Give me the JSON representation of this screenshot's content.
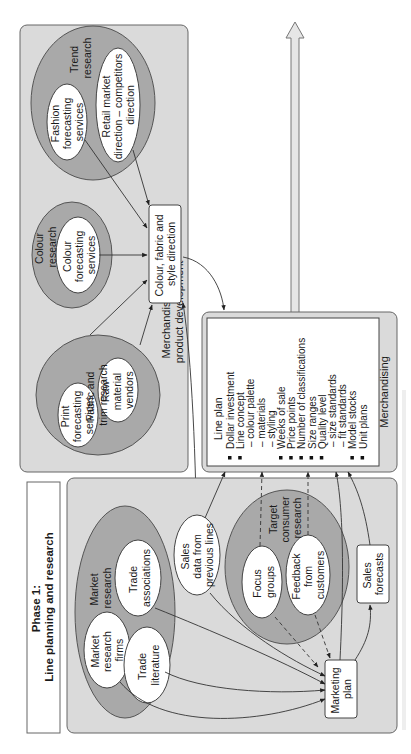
{
  "phase": {
    "title_line1": "Phase 1:",
    "title_line2": "Line planning and research"
  },
  "product_development_panel": {
    "label_line1": "Merchandising and",
    "label_line2": "product development",
    "fabric_trim": {
      "label_line1": "Fabric and",
      "label_line2": "trim research",
      "nodes": [
        {
          "l1": "Print",
          "l2": "forecasting",
          "l3": "services"
        },
        {
          "l1": "Raw",
          "l2": "material",
          "l3": "vendors"
        }
      ]
    },
    "colour": {
      "label_line1": "Colour",
      "label_line2": "research",
      "node": {
        "l1": "Colour",
        "l2": "forecasting",
        "l3": "services"
      }
    },
    "trend": {
      "label_line1": "Trend",
      "label_line2": "research",
      "nodes": [
        {
          "l1": "Fashion",
          "l2": "forecasting",
          "l3": "services"
        },
        {
          "l1": "Retail market",
          "l2": "direction – competitors",
          "l3": "direction"
        }
      ]
    },
    "direction_box": {
      "l1": "Colour, fabric and",
      "l2": "style direction"
    }
  },
  "market_panel": {
    "market_research": {
      "label_line1": "Market",
      "label_line2": "research",
      "nodes": [
        {
          "l1": "Market",
          "l2": "research",
          "l3": "firms"
        },
        {
          "l1": "Trade",
          "l2": "associations"
        },
        {
          "l1": "Trade",
          "l2": "literature"
        }
      ]
    },
    "sales_data": {
      "l1": "Sales",
      "l2": "data from",
      "l3": "previous lines"
    },
    "target_consumer": {
      "label_line1": "Target",
      "label_line2": "consumer",
      "label_line3": "research",
      "nodes": [
        {
          "l1": "Focus",
          "l2": "groups"
        },
        {
          "l1": "Feedback",
          "l2": "from",
          "l3": "customers"
        }
      ]
    },
    "marketing_plan": {
      "l1": "Marketing",
      "l2": "plan"
    },
    "sales_forecasts": {
      "l1": "Sales",
      "l2": "forecasts"
    }
  },
  "merchandising": {
    "heading": "Line plan",
    "footer": "Merchandising",
    "items": [
      {
        "bullet": true,
        "text": "Dollar investment"
      },
      {
        "bullet": true,
        "text": "Line concept"
      },
      {
        "bullet": false,
        "text": "– colour palette"
      },
      {
        "bullet": false,
        "text": "– materials"
      },
      {
        "bullet": false,
        "text": "– styling"
      },
      {
        "bullet": true,
        "text": "Weeks of sale"
      },
      {
        "bullet": true,
        "text": "Price points"
      },
      {
        "bullet": true,
        "text": "Number of classifications"
      },
      {
        "bullet": true,
        "text": "Size ranges"
      },
      {
        "bullet": true,
        "text": "Quality level"
      },
      {
        "bullet": false,
        "text": "– size standards"
      },
      {
        "bullet": false,
        "text": "– fit standards"
      },
      {
        "bullet": true,
        "text": "Model stocks"
      },
      {
        "bullet": true,
        "text": "Unit plans"
      }
    ]
  }
}
